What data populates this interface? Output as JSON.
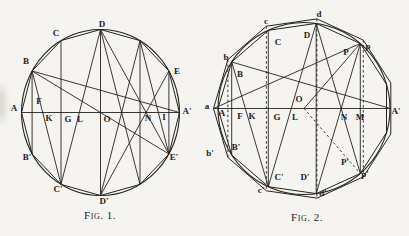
{
  "page": {
    "background": "#f5f4f0",
    "ink": "#24231f"
  },
  "captions": {
    "fig1": "Fig. 1.",
    "fig2": "Fig. 2."
  },
  "figures": [
    {
      "name": "fig1",
      "circle": {
        "cx": 100.5,
        "cy": 112.5,
        "rx": 79,
        "ry": 83
      },
      "points": {
        "A": [
          21.5,
          112.5
        ],
        "B": [
          32.1,
          71.0
        ],
        "C": [
          61.0,
          40.6
        ],
        "D": [
          100.5,
          29.5
        ],
        "Q": [
          140.0,
          40.6
        ],
        "E": [
          168.9,
          71.0
        ],
        "Ap": [
          179.5,
          112.5
        ],
        "Ep": [
          168.9,
          154.0
        ],
        "Qp": [
          140.0,
          184.4
        ],
        "Dp": [
          100.5,
          195.5
        ],
        "Cp": [
          61.0,
          184.4
        ],
        "Bp": [
          32.1,
          154.0
        ],
        "O": [
          100.5,
          112.5
        ]
      },
      "polygons": [
        {
          "pts": [
            "A",
            "B",
            "C",
            "D",
            "Q",
            "E",
            "Ap",
            "Ep",
            "Qp",
            "Dp",
            "Cp",
            "Bp"
          ],
          "dash": false
        }
      ],
      "lines": [
        {
          "from": "A",
          "to": "Ap",
          "dash": false
        },
        {
          "from": "B",
          "to": "Bp",
          "dash": false
        },
        {
          "from": "C",
          "to": "Cp",
          "dash": false
        },
        {
          "from": "D",
          "to": "Dp",
          "dash": false
        },
        {
          "from": "Q",
          "to": "Qp",
          "dash": false
        },
        {
          "from": "E",
          "to": "Ep",
          "dash": false
        },
        {
          "from": "B",
          "to": "Cp",
          "dash": false
        },
        {
          "from": "D",
          "to": "Cp",
          "dash": false
        },
        {
          "from": "D",
          "to": "Qp",
          "dash": false
        },
        {
          "from": "Dp",
          "to": "Q",
          "dash": false
        },
        {
          "from": "D",
          "to": "Ep",
          "dash": false
        },
        {
          "from": "Dp",
          "to": "E",
          "dash": false
        },
        {
          "from": "Q",
          "to": "Ep",
          "dash": false
        },
        {
          "from": "B",
          "to": "Ap",
          "dash": false
        },
        {
          "from": "B",
          "to": "Ep",
          "dash": false
        }
      ],
      "labels": [
        {
          "t": "A",
          "x": 14,
          "y": 108
        },
        {
          "t": "B",
          "x": 26,
          "y": 61
        },
        {
          "t": "C",
          "x": 56,
          "y": 33
        },
        {
          "t": "D",
          "x": 102,
          "y": 24
        },
        {
          "t": "E",
          "x": 177,
          "y": 71
        },
        {
          "t": "A'",
          "x": 187,
          "y": 111
        },
        {
          "t": "E'",
          "x": 174,
          "y": 157
        },
        {
          "t": "D'",
          "x": 104,
          "y": 201
        },
        {
          "t": "C'",
          "x": 58,
          "y": 189
        },
        {
          "t": "B'",
          "x": 27,
          "y": 157
        },
        {
          "t": "F",
          "x": 39,
          "y": 101
        },
        {
          "t": "K",
          "x": 49,
          "y": 118
        },
        {
          "t": "G",
          "x": 68,
          "y": 119
        },
        {
          "t": "L",
          "x": 80,
          "y": 119
        },
        {
          "t": "O",
          "x": 107,
          "y": 119
        },
        {
          "t": "N",
          "x": 148,
          "y": 118
        },
        {
          "t": "I",
          "x": 164,
          "y": 117
        }
      ]
    },
    {
      "name": "fig2",
      "circle": {
        "cx": 304,
        "cy": 108.5,
        "rx": 86,
        "ry": 86
      },
      "points": {
        "A": [
          218.0,
          108.5
        ],
        "B": [
          231.7,
          62.0
        ],
        "C": [
          268.3,
          30.3
        ],
        "D": [
          316.2,
          23.4
        ],
        "P": [
          360.3,
          43.5
        ],
        "V": [
          386.5,
          84.3
        ],
        "W": [
          386.5,
          132.7
        ],
        "Pp": [
          360.3,
          173.5
        ],
        "Dp": [
          316.2,
          193.6
        ],
        "Cp": [
          268.3,
          186.7
        ],
        "Bp": [
          231.7,
          155.0
        ],
        "a": [
          213.5,
          108.5
        ],
        "b": [
          227.9,
          59.6
        ],
        "c": [
          266.4,
          26.2
        ],
        "d": [
          316.9,
          18.9
        ],
        "p": [
          363.3,
          40.1
        ],
        "v": [
          390.8,
          83.0
        ],
        "w": [
          390.8,
          134.0
        ],
        "pp": [
          363.3,
          176.9
        ],
        "dp": [
          316.9,
          198.1
        ],
        "cp": [
          266.4,
          190.8
        ],
        "bp": [
          227.9,
          157.4
        ],
        "O": [
          304,
          108.5
        ],
        "Ar": [
          390.5,
          108.5
        ]
      },
      "polygons": [
        {
          "pts": [
            "A",
            "B",
            "C",
            "D",
            "P",
            "V",
            "W",
            "Pp",
            "Dp",
            "Cp",
            "Bp"
          ],
          "dash": false
        },
        {
          "pts": [
            "a",
            "b",
            "c",
            "d",
            "p",
            "v",
            "w",
            "pp",
            "dp",
            "cp",
            "bp"
          ],
          "dash": false
        }
      ],
      "lines": [
        {
          "from": "a",
          "to": "Ar",
          "dash": false
        },
        {
          "from": "B",
          "to": "Bp",
          "dash": false
        },
        {
          "from": "C",
          "to": "Cp",
          "dash": false
        },
        {
          "from": "D",
          "to": "Dp",
          "dash": false
        },
        {
          "from": "P",
          "to": "Pp",
          "dash": false
        },
        {
          "from": "b",
          "to": "bp",
          "dash": true
        },
        {
          "from": "c",
          "to": "cp",
          "dash": true
        },
        {
          "from": "d",
          "to": "dp",
          "dash": true
        },
        {
          "from": "p",
          "to": "pp",
          "dash": true
        },
        {
          "from": "B",
          "to": "Cp",
          "dash": false
        },
        {
          "from": "D",
          "to": "Cp",
          "dash": false
        },
        {
          "from": "D",
          "to": "Pp",
          "dash": false
        },
        {
          "from": "P",
          "to": "Dp",
          "dash": false
        },
        {
          "from": "B",
          "to": "Ar",
          "dash": false
        },
        {
          "from": "a",
          "to": "P",
          "dash": false
        },
        {
          "from": "P",
          "to": "O",
          "dash": false
        },
        {
          "from": "O",
          "to": "Pp",
          "dash": true
        }
      ],
      "labels": [
        {
          "t": "a",
          "x": 207,
          "y": 106
        },
        {
          "t": "b",
          "x": 226,
          "y": 57
        },
        {
          "t": "c",
          "x": 266,
          "y": 21
        },
        {
          "t": "d",
          "x": 319,
          "y": 14
        },
        {
          "t": "p",
          "x": 368,
          "y": 46
        },
        {
          "t": "A'",
          "x": 396,
          "y": 111
        },
        {
          "t": "p'",
          "x": 365,
          "y": 174
        },
        {
          "t": "d'",
          "x": 323,
          "y": 193
        },
        {
          "t": "c'",
          "x": 261,
          "y": 190
        },
        {
          "t": "b'",
          "x": 210,
          "y": 153
        },
        {
          "t": "A",
          "x": 222,
          "y": 113
        },
        {
          "t": "B",
          "x": 240,
          "y": 74
        },
        {
          "t": "C",
          "x": 278,
          "y": 42
        },
        {
          "t": "D",
          "x": 307,
          "y": 35
        },
        {
          "t": "P",
          "x": 346,
          "y": 52
        },
        {
          "t": "B'",
          "x": 236,
          "y": 147
        },
        {
          "t": "C'",
          "x": 279,
          "y": 177
        },
        {
          "t": "D'",
          "x": 305,
          "y": 177
        },
        {
          "t": "P'",
          "x": 345,
          "y": 162
        },
        {
          "t": "F",
          "x": 240,
          "y": 116
        },
        {
          "t": "K",
          "x": 252,
          "y": 116
        },
        {
          "t": "G",
          "x": 277,
          "y": 117
        },
        {
          "t": "L",
          "x": 295,
          "y": 117
        },
        {
          "t": "O",
          "x": 299,
          "y": 99
        },
        {
          "t": "N",
          "x": 344,
          "y": 117
        },
        {
          "t": "M",
          "x": 360,
          "y": 117
        }
      ]
    }
  ]
}
